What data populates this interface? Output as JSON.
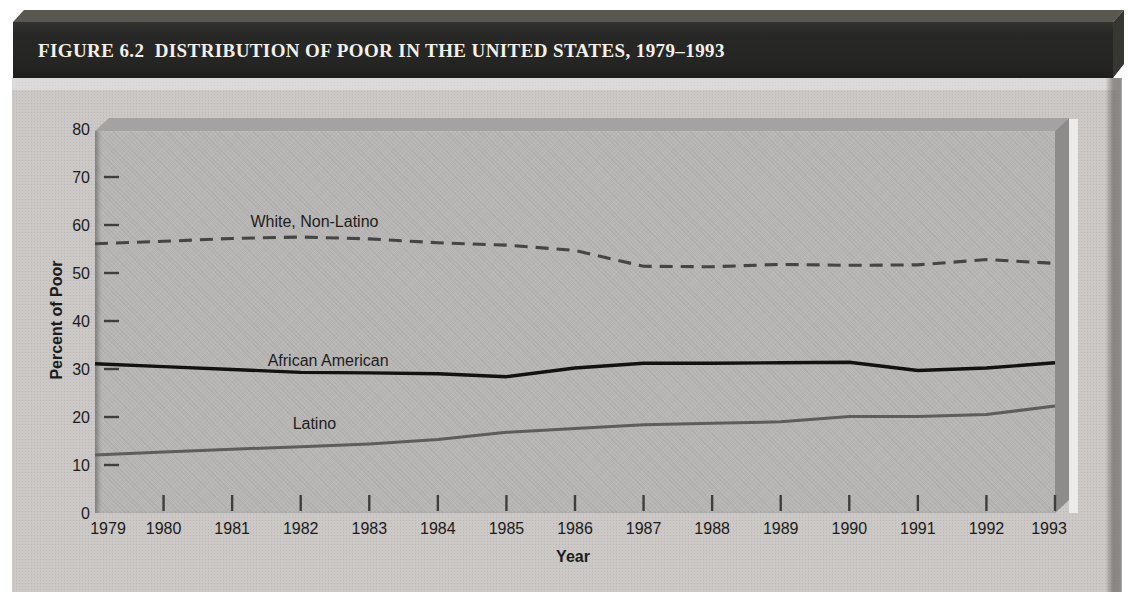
{
  "figure": {
    "title": "FIGURE 6.2  DISTRIBUTION OF POOR IN THE UNITED STATES, 1979–1993"
  },
  "chart_data": {
    "type": "line",
    "title": "Distribution of Poor in the United States, 1979–1993",
    "xlabel": "Year",
    "ylabel": "Percent of Poor",
    "ylim": [
      0,
      80
    ],
    "yticks": [
      0,
      10,
      20,
      30,
      40,
      50,
      60,
      70,
      80
    ],
    "x": [
      1979,
      1980,
      1981,
      1982,
      1983,
      1984,
      1985,
      1986,
      1987,
      1988,
      1989,
      1990,
      1991,
      1992,
      1993
    ],
    "grid": false,
    "legend_position": "inline-labels",
    "series": [
      {
        "id": "white-non-latino",
        "name": "White, Non-Latino",
        "style": "dashed",
        "color": "#454543",
        "stroke_width": 3.1,
        "label_pos": {
          "year": 1982.2,
          "value": 60.7
        },
        "values": [
          56.1,
          56.6,
          57.2,
          57.5,
          57.1,
          56.3,
          55.8,
          54.7,
          51.4,
          51.3,
          51.8,
          51.6,
          51.7,
          52.8,
          52.0
        ]
      },
      {
        "id": "african-american",
        "name": "African American",
        "style": "solid",
        "color": "#121211",
        "stroke_width": 3.4,
        "label_pos": {
          "year": 1982.4,
          "value": 31.6
        },
        "values": [
          31.1,
          30.5,
          29.9,
          29.3,
          29.2,
          29.0,
          28.4,
          30.2,
          31.2,
          31.2,
          31.3,
          31.4,
          29.7,
          30.2,
          31.3
        ]
      },
      {
        "id": "latino",
        "name": "Latino",
        "style": "solid",
        "color": "#5e5d5b",
        "stroke_width": 3.0,
        "label_pos": {
          "year": 1982.2,
          "value": 18.6
        },
        "values": [
          12.1,
          12.7,
          13.3,
          13.8,
          14.4,
          15.3,
          16.8,
          17.6,
          18.4,
          18.7,
          19.0,
          20.1,
          20.1,
          20.5,
          22.3
        ]
      }
    ]
  },
  "colors": {
    "page_bg": "#ffffff",
    "titlebar_front": "#262624",
    "titlebar_topface": "#5a5751",
    "titlebar_text": "#f3f1ea",
    "panel_bg": "#cbc8c6",
    "panel_shadow": "#8d8a88",
    "plot_bg": "#b8b6b4",
    "plot_topface": "#a5a3a1",
    "plot_rightface": "#8e8c8a",
    "plot_highlight": "#edebe9",
    "tick_color": "#3e3e3c",
    "axis_text": "#1c1c1b"
  }
}
